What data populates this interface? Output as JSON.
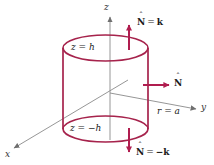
{
  "figure": {
    "type": "3d-cylinder-surface-diagram",
    "background": "#ffffff",
    "curve_color": "#a6234c",
    "axis_color": "#8a8a8a",
    "arrow_color": "#b01d4f"
  },
  "axes": {
    "x_label": "x",
    "y_label": "y",
    "z_label": "z"
  },
  "surfaces": {
    "top_disc_label": "z = h",
    "bottom_disc_label": "z = −h",
    "side_label": "r = a"
  },
  "normals": {
    "top": {
      "symbol": "N",
      "hat": "ˆ",
      "equals": "=",
      "value": "k"
    },
    "side": {
      "symbol": "N",
      "hat": "ˆ"
    },
    "bottom": {
      "symbol": "N",
      "hat": "ˆ",
      "equals": "=",
      "value": "−k"
    }
  },
  "geometry": {
    "cylinder_left_x": 63,
    "cylinder_right_x": 148,
    "top_ellipse_cy": 48,
    "bottom_ellipse_cy": 129,
    "ellipse_rx": 42.5,
    "ellipse_ry": 13,
    "origin_x": 110,
    "origin_y": 93
  }
}
